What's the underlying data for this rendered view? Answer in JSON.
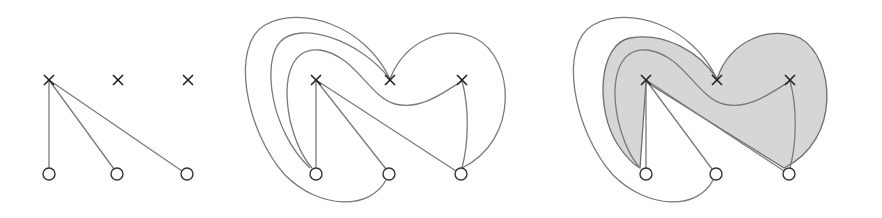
{
  "figure": {
    "panels": [
      {
        "id": "panel-1",
        "top_nodes": [
          "cross",
          "cross",
          "cross"
        ],
        "bottom_nodes": [
          "circle",
          "circle",
          "circle"
        ],
        "edges": [
          {
            "from": "top-1",
            "to": "bottom-1",
            "kind": "straight"
          },
          {
            "from": "top-1",
            "to": "bottom-2",
            "kind": "straight"
          },
          {
            "from": "top-1",
            "to": "bottom-3",
            "kind": "straight"
          }
        ],
        "shaded": false
      },
      {
        "id": "panel-2",
        "top_nodes": [
          "cross",
          "cross",
          "cross"
        ],
        "bottom_nodes": [
          "circle",
          "circle",
          "circle"
        ],
        "edges": [
          {
            "from": "top-1",
            "to": "bottom-1",
            "kind": "straight"
          },
          {
            "from": "top-1",
            "to": "bottom-2",
            "kind": "straight"
          },
          {
            "from": "top-1",
            "to": "bottom-3",
            "kind": "straight"
          },
          {
            "from": "top-2",
            "to": "bottom-1",
            "kind": "curved"
          },
          {
            "from": "top-2",
            "to": "bottom-2",
            "kind": "curved"
          },
          {
            "from": "top-2",
            "to": "bottom-3",
            "kind": "curved"
          },
          {
            "from": "top-3",
            "to": "bottom-1",
            "kind": "curved"
          },
          {
            "from": "top-3",
            "to": "bottom-3",
            "kind": "straight"
          }
        ],
        "shaded": false
      },
      {
        "id": "panel-3",
        "top_nodes": [
          "cross",
          "cross",
          "cross"
        ],
        "bottom_nodes": [
          "circle",
          "circle",
          "circle"
        ],
        "edges": "same as panel-2",
        "shaded": true
      }
    ],
    "colors": {
      "edge": "#7a7a7a",
      "shade": "#d6d6d6",
      "node": "#222222",
      "background": "#ffffff"
    }
  }
}
